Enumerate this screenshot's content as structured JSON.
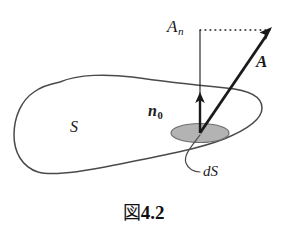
{
  "figure": {
    "caption_kanji": "図",
    "caption_number": "4.2",
    "labels": {
      "normal_component": "A",
      "normal_component_sub": "n",
      "vector_field": "A",
      "unit_normal": "n",
      "unit_normal_sub": "0",
      "surface": "S",
      "area_element": "dS"
    },
    "colors": {
      "background": "#ffffff",
      "ink": "#1a1a1a",
      "outline": "#4a4a4a",
      "patch_fill": "#b3b3b3",
      "patch_stroke": "#6e6e6e"
    },
    "elements": {
      "surface_outline": "closed-blob-curve",
      "area_patch": "shaded-ellipse",
      "normal_arrow": "vertical-arrow-up",
      "field_arrow": "thick-arrow-up-right",
      "projection_line": "dotted-horizontal",
      "component_line": "thin-vertical",
      "leader_line": "curved-leader-to-dS"
    }
  }
}
